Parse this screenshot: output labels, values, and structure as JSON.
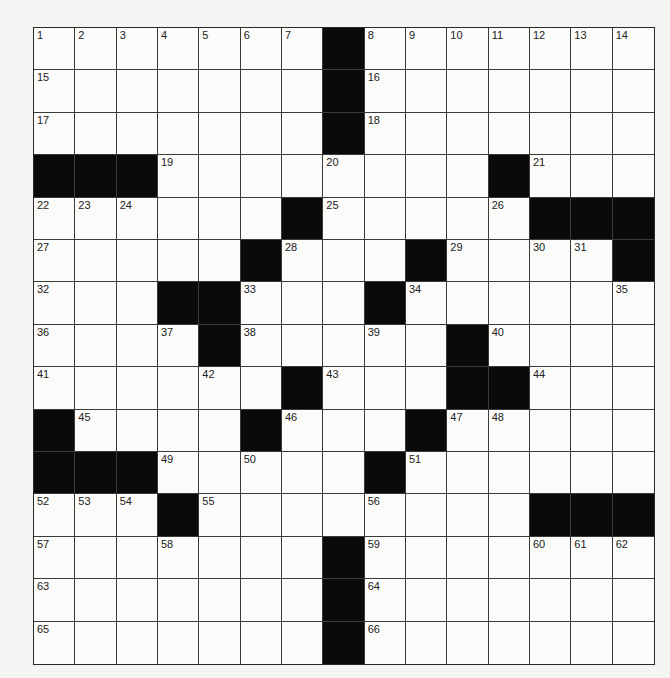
{
  "puzzle": {
    "rows": 15,
    "cols": 15,
    "layout": [
      "1234567B8901234",
      "...............",
      "..............."
    ],
    "grid": [
      [
        1,
        2,
        3,
        4,
        5,
        6,
        7,
        "B",
        8,
        9,
        10,
        11,
        12,
        13,
        14
      ],
      [
        15,
        0,
        0,
        0,
        0,
        0,
        0,
        "B",
        16,
        0,
        0,
        0,
        0,
        0,
        0
      ],
      [
        17,
        0,
        0,
        0,
        0,
        0,
        0,
        "B",
        18,
        0,
        0,
        0,
        0,
        0,
        0
      ],
      [
        "B",
        "B",
        "B",
        19,
        0,
        0,
        0,
        20,
        0,
        0,
        0,
        "B",
        21,
        0,
        0
      ],
      [
        22,
        23,
        24,
        0,
        0,
        0,
        "B",
        25,
        0,
        0,
        0,
        26,
        "B",
        "B",
        "B"
      ],
      [
        27,
        0,
        0,
        0,
        0,
        "B",
        28,
        0,
        0,
        "B",
        29,
        0,
        30,
        31,
        "B"
      ],
      [
        32,
        0,
        0,
        "B",
        "B",
        33,
        0,
        0,
        "B",
        34,
        0,
        0,
        0,
        0,
        35
      ],
      [
        36,
        0,
        0,
        37,
        "B",
        38,
        0,
        0,
        39,
        0,
        "B",
        40,
        0,
        0,
        0
      ],
      [
        41,
        0,
        0,
        0,
        42,
        0,
        "B",
        43,
        0,
        0,
        "B",
        "B",
        44,
        0,
        0
      ],
      [
        "B",
        45,
        0,
        0,
        0,
        "B",
        46,
        0,
        0,
        "B",
        47,
        48,
        0,
        0,
        0
      ],
      [
        "B",
        "B",
        "B",
        49,
        0,
        50,
        0,
        0,
        "B",
        51,
        0,
        0,
        0,
        0,
        0
      ],
      [
        52,
        53,
        54,
        "B",
        55,
        0,
        0,
        0,
        56,
        0,
        0,
        0,
        "B",
        "B",
        "B"
      ],
      [
        57,
        0,
        0,
        58,
        0,
        0,
        0,
        "B",
        59,
        0,
        0,
        0,
        60,
        61,
        62
      ],
      [
        63,
        0,
        0,
        0,
        0,
        0,
        0,
        "B",
        64,
        0,
        0,
        0,
        0,
        0,
        0
      ],
      [
        65,
        0,
        0,
        0,
        0,
        0,
        0,
        "B",
        66,
        0,
        0,
        0,
        0,
        0,
        0
      ]
    ]
  },
  "colors": {
    "black_square": "#0a0a0a",
    "white_square": "#fbfbf9",
    "grid_line": "#3a3a3a",
    "background": "#f4f4f2"
  }
}
